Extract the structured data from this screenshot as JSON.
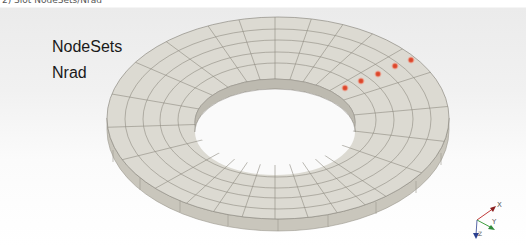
{
  "caption": "2) Slot NodeSets/Nrad",
  "labels": {
    "nodesets": "NodeSets",
    "nrad": "Nrad"
  },
  "mesh": {
    "fill": "#dcdad2",
    "side_fill": "#c9c6bc",
    "inner_wall_fill": "#bdbab0",
    "edge_color": "#8e8b82",
    "node_color": "#d9472b"
  },
  "nodes": [
    {
      "x": 345,
      "y": 88
    },
    {
      "x": 361,
      "y": 81
    },
    {
      "x": 378,
      "y": 74
    },
    {
      "x": 395,
      "y": 66
    },
    {
      "x": 411,
      "y": 60
    }
  ],
  "axes": {
    "x": {
      "label": "X",
      "color": "#c23b3b"
    },
    "y": {
      "label": "Y",
      "color": "#3f9e3f"
    },
    "z": {
      "label": "Z",
      "color": "#2a3f8f"
    }
  }
}
